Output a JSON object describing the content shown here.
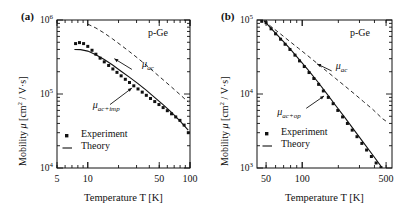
{
  "figure": {
    "background": "#ffffff",
    "ink": "#111111"
  },
  "panels": [
    {
      "id": "a",
      "label": "(a)",
      "material": "p-Ge",
      "ylabel_prefix": "Mobility",
      "ylabel_mu": "μ",
      "ylabel_units": "[cm",
      "ylabel_units_exp": "2",
      "ylabel_units_tail": " / V·s]",
      "xlabel": "Temperature T [K]",
      "ytick_labels": [
        "10",
        "10",
        "10"
      ],
      "ytick_exps": [
        "6",
        "5",
        "4"
      ],
      "xtick_labels": [
        "5",
        "10",
        "50",
        "100"
      ],
      "ann_ac": "μ",
      "ann_ac_sub": "ac",
      "ann_mix": "μ",
      "ann_mix_sub": "ac+imp",
      "legend": [
        {
          "marker": "square",
          "label": "Experiment"
        },
        {
          "marker": "line",
          "label": "Theory"
        }
      ],
      "chart_data": {
        "type": "line",
        "title": "",
        "xlabel": "Temperature T [K]",
        "ylabel": "Mobility μ [cm2 / V·s]",
        "xscale": "log",
        "yscale": "log",
        "xlim": [
          5,
          100
        ],
        "ylim": [
          10000,
          1000000
        ],
        "xticks": [
          5,
          10,
          50,
          100
        ],
        "yticks": [
          10000,
          100000,
          1000000
        ],
        "grid": false,
        "annotations": [
          {
            "text": "p-Ge",
            "x": 70,
            "y": 620000
          },
          {
            "text": "μ_ac",
            "x": 33,
            "y": 200000
          },
          {
            "text": "μ_ac+imp",
            "x": 19,
            "y": 62000
          }
        ],
        "series": [
          {
            "name": "Experiment",
            "style": "points",
            "x": [
              7.6,
              8.3,
              9.1,
              10.0,
              11.0,
              12.0,
              13.2,
              14.5,
              16.0,
              17.6,
              19.3,
              21.2,
              23.3,
              25.6,
              28.2,
              31.0,
              34.1,
              37.4,
              41.1,
              45.2,
              49.7,
              54.6,
              60.0,
              66.0,
              72.5,
              79.7,
              87.6,
              96.3
            ],
            "y": [
              480000,
              495000,
              480000,
              440000,
              390000,
              345000,
              305000,
              272000,
              243000,
              218000,
              196000,
              176000,
              158000,
              143000,
              129000,
              117000,
              106000,
              96000,
              87000,
              79000,
              72000,
              65500,
              59500,
              54000,
              49000,
              44000,
              38000,
              30000
            ]
          },
          {
            "name": "Theory (mu_ac+imp)",
            "style": "solid",
            "x": [
              7.4,
              8.5,
              10.0,
              12.0,
              14.5,
              17.5,
              21.0,
              25.5,
              31.0,
              37.5,
              45.0,
              54.5,
              66.0,
              80.0,
              96.0
            ],
            "y": [
              400000,
              398000,
              380000,
              340000,
              292000,
              246000,
              205000,
              169000,
              138000,
              112000,
              90000,
              72000,
              56500,
              43000,
              32500
            ]
          },
          {
            "name": "mu_ac",
            "style": "dashed",
            "x": [
              10.0,
              12.0,
              14.5,
              17.5,
              21.0,
              25.5,
              31.0,
              37.5,
              45.0,
              54.5,
              66.0,
              80.0,
              96.0
            ],
            "y": [
              880000,
              780000,
              665000,
              555000,
              460000,
              375000,
              303000,
              244000,
              196000,
              156000,
              124000,
              98000,
              78000
            ]
          }
        ]
      }
    },
    {
      "id": "b",
      "label": "(b)",
      "material": "p-Ge",
      "ylabel_prefix": "Mobility",
      "ylabel_mu": "μ",
      "ylabel_units": "[cm",
      "ylabel_units_exp": "2",
      "ylabel_units_tail": " / V·s]",
      "xlabel": "Temperature T [K]",
      "ytick_labels": [
        "10",
        "10",
        "10"
      ],
      "ytick_exps": [
        "5",
        "4",
        "3"
      ],
      "xtick_labels": [
        "50",
        "100",
        "500"
      ],
      "ann_ac": "μ",
      "ann_ac_sub": "ac",
      "ann_mix": "μ",
      "ann_mix_sub": "ac+op",
      "legend": [
        {
          "marker": "square",
          "label": "Experiment"
        },
        {
          "marker": "line",
          "label": "Theory"
        }
      ],
      "chart_data": {
        "type": "line",
        "title": "",
        "xlabel": "Temperature T [K]",
        "ylabel": "Mobility μ [cm2 / V·s]",
        "xscale": "log",
        "yscale": "log",
        "xlim": [
          42,
          560
        ],
        "ylim": [
          1000,
          100000
        ],
        "xticks": [
          50,
          100,
          500
        ],
        "yticks": [
          1000,
          10000,
          100000
        ],
        "grid": false,
        "annotations": [
          {
            "text": "p-Ge",
            "x": 330,
            "y": 62000
          },
          {
            "text": "μ_ac",
            "x": 185,
            "y": 19500
          },
          {
            "text": "μ_ac+op",
            "x": 97,
            "y": 5600
          }
        ],
        "series": [
          {
            "name": "Experiment",
            "style": "points",
            "x": [
              46,
              50,
              55,
              60,
              66,
              72,
              79,
              87,
              95,
              104,
              114,
              125,
              137,
              150,
              165,
              181,
              198,
              217,
              238,
              261,
              286,
              314,
              344,
              377,
              413,
              453
            ],
            "y": [
              96000,
              92000,
              76000,
              65000,
              55000,
              47000,
              40000,
              33500,
              28000,
              23500,
              19500,
              16200,
              13500,
              11000,
              9000,
              7400,
              6000,
              4900,
              4000,
              3250,
              2650,
              2150,
              1750,
              1430,
              1170,
              1010
            ]
          },
          {
            "name": "Theory (mu_ac+op)",
            "style": "solid",
            "x": [
              48,
              55,
              65,
              78,
              93,
              111,
              133,
              159,
              190,
              227,
              271,
              324,
              387,
              462
            ],
            "y": [
              98000,
              77000,
              58000,
              42000,
              30000,
              21500,
              15000,
              10300,
              7000,
              4800,
              3250,
              2200,
              1500,
              1010
            ]
          },
          {
            "name": "mu_ac",
            "style": "dashed",
            "x": [
              48,
              55,
              65,
              78,
              93,
              111,
              133,
              159,
              190,
              227,
              271,
              324,
              387,
              462,
              520
            ],
            "y": [
              98000,
              81500,
              66000,
              52000,
              41500,
              33000,
              26000,
              20500,
              16200,
              12800,
              10100,
              7900,
              6200,
              4700,
              4100
            ]
          }
        ]
      }
    }
  ]
}
